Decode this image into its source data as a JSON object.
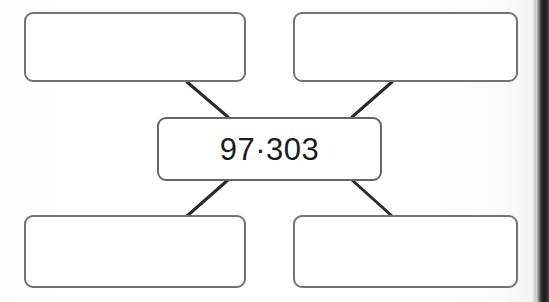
{
  "page": {
    "kind": "scanned-worksheet",
    "diagram_type": "number-bond",
    "background_color": "#ffffff",
    "gutter_color": "#1d1d1d",
    "box_border_color": "#6e6e6e",
    "text_color": "#1c1c1c",
    "connector_color": "#2a2a2a"
  },
  "diagram": {
    "center": {
      "name": "center-value-box",
      "value": "97·303",
      "filled": true
    },
    "branches": [
      {
        "name": "top-left-answer-box",
        "position": "top-left",
        "value": "",
        "filled": false
      },
      {
        "name": "top-right-answer-box",
        "position": "top-right",
        "value": "",
        "filled": false
      },
      {
        "name": "bottom-left-answer-box",
        "position": "bottom-left",
        "value": "",
        "filled": false
      },
      {
        "name": "bottom-right-answer-box",
        "position": "bottom-right",
        "value": "",
        "filled": false
      }
    ],
    "connectors": [
      {
        "name": "connector-top-left",
        "from": "top-left-answer-box",
        "to": "center-value-box"
      },
      {
        "name": "connector-top-right",
        "from": "top-right-answer-box",
        "to": "center-value-box"
      },
      {
        "name": "connector-bottom-left",
        "from": "center-value-box",
        "to": "bottom-left-answer-box"
      },
      {
        "name": "connector-bottom-right",
        "from": "center-value-box",
        "to": "bottom-right-answer-box"
      }
    ]
  }
}
